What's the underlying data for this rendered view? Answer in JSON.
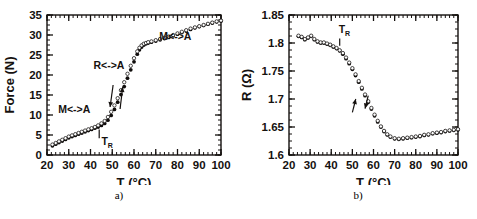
{
  "figure": {
    "caption_a": "a)",
    "caption_b": "b)"
  },
  "chart_data": [
    {
      "id": "panel-a",
      "type": "scatter",
      "title": "",
      "xlabel": "T (°C)",
      "ylabel": "Force (N)",
      "xlim": [
        20,
        100
      ],
      "ylim": [
        0,
        35
      ],
      "xticks": [
        20,
        30,
        40,
        50,
        60,
        70,
        80,
        90,
        100
      ],
      "yticks": [
        0,
        5,
        10,
        15,
        20,
        25,
        30,
        35
      ],
      "xminor_step": 2,
      "yminor_step": 1.25,
      "grid": false,
      "legend": "none",
      "annotations": [
        {
          "name": "phase-label-low",
          "text": "M<->A",
          "x": 32.5,
          "y": 10.5
        },
        {
          "name": "phase-label-mid",
          "text": "R<->A",
          "x": 48.5,
          "y": 21.5
        },
        {
          "name": "phase-label-high",
          "text": "M<->A",
          "x": 79.0,
          "y": 28.8
        },
        {
          "name": "transition-temp-label",
          "text": "T",
          "sub": "R",
          "x": 45.0,
          "y": 2.6
        }
      ],
      "tick_marker": {
        "name": "transition-temp-tick",
        "x": 44.0,
        "y0": 4.2,
        "y1": 6.4
      },
      "arrows": [
        {
          "name": "cooling-arrow",
          "x0": 50.4,
          "y0": 17.5,
          "x1": 49.0,
          "y1": 12.0,
          "dir": "down"
        },
        {
          "name": "heating-arrow",
          "x0": 53.6,
          "y0": 11.5,
          "x1": 54.8,
          "y1": 17.0,
          "dir": "up"
        }
      ],
      "series": [
        {
          "name": "heating",
          "marker": "filled",
          "x": [
            22.5,
            24.0,
            25.5,
            27.0,
            28.5,
            30.0,
            31.5,
            33.0,
            34.5,
            36.0,
            37.5,
            39.0,
            40.5,
            42.0,
            43.5,
            45.0,
            46.5,
            48.0,
            49.5,
            51.0,
            52.5,
            54.0,
            55.5,
            57.0,
            58.5,
            60.0,
            61.5,
            62.5,
            63.5,
            64.5,
            65.5,
            66.5,
            68.0,
            70.0,
            72.0,
            74.0,
            76.0,
            78.0,
            80.0,
            82.0,
            84.0,
            86.0,
            88.0,
            90.0,
            92.0,
            94.0,
            96.0,
            98.0,
            100.0
          ],
          "y": [
            2.3,
            2.7,
            3.1,
            3.5,
            3.9,
            4.3,
            4.6,
            4.9,
            5.2,
            5.5,
            5.8,
            6.1,
            6.4,
            6.7,
            7.0,
            7.4,
            7.9,
            8.7,
            9.9,
            11.4,
            13.2,
            15.1,
            17.1,
            19.2,
            21.3,
            23.3,
            25.2,
            26.3,
            27.0,
            27.5,
            27.8,
            28.0,
            28.2,
            28.5,
            28.8,
            29.1,
            29.4,
            29.8,
            30.2,
            30.6,
            31.0,
            31.4,
            31.8,
            32.1,
            32.4,
            32.7,
            33.0,
            33.3,
            33.5
          ]
        },
        {
          "name": "cooling",
          "marker": "open",
          "x": [
            22.5,
            24.0,
            25.5,
            27.0,
            28.5,
            30.0,
            31.5,
            33.0,
            34.5,
            36.0,
            37.5,
            39.0,
            40.5,
            42.0,
            43.5,
            45.0,
            46.5,
            48.0,
            49.5,
            51.0,
            52.5,
            54.0,
            55.5,
            57.0,
            58.5,
            60.0,
            61.5,
            62.5,
            63.5,
            64.5,
            65.5,
            66.5,
            68.0,
            70.0,
            72.0,
            74.0,
            76.0,
            78.0,
            80.0,
            82.0,
            84.0,
            86.0,
            88.0,
            90.0,
            92.0,
            94.0,
            96.0,
            98.0,
            100.0
          ],
          "y": [
            2.6,
            3.0,
            3.4,
            3.8,
            4.2,
            4.6,
            4.9,
            5.2,
            5.5,
            5.8,
            6.1,
            6.4,
            6.7,
            7.0,
            7.4,
            7.9,
            8.5,
            9.5,
            10.8,
            12.4,
            14.2,
            16.2,
            18.2,
            20.3,
            22.3,
            24.2,
            25.9,
            26.8,
            27.4,
            27.8,
            28.0,
            28.2,
            28.4,
            28.7,
            29.0,
            29.3,
            29.6,
            30.0,
            30.4,
            30.8,
            31.2,
            31.6,
            31.9,
            32.2,
            32.5,
            32.8,
            33.1,
            33.4,
            33.6
          ]
        }
      ]
    },
    {
      "id": "panel-b",
      "type": "scatter",
      "title": "",
      "xlabel": "T (°C)",
      "ylabel": "R (Ω)",
      "xlim": [
        20,
        100
      ],
      "ylim": [
        1.6,
        1.85
      ],
      "xticks": [
        20,
        30,
        40,
        50,
        60,
        70,
        80,
        90,
        100
      ],
      "yticks": [
        1.6,
        1.65,
        1.7,
        1.75,
        1.8,
        1.85
      ],
      "xminor_step": 2,
      "yminor_step": 0.0125,
      "grid": false,
      "legend": "none",
      "annotations": [
        {
          "name": "transition-temp-label",
          "text": "T",
          "sub": "R",
          "x": 43.5,
          "y": 1.818
        }
      ],
      "tick_marker": {
        "name": "transition-temp-tick",
        "x": 44.0,
        "y0": 1.795,
        "y1": 1.808
      },
      "arrows": [
        {
          "name": "heating-arrow",
          "x0": 50.0,
          "y0": 1.676,
          "x1": 51.6,
          "y1": 1.7,
          "dir": "up"
        },
        {
          "name": "cooling-arrow",
          "x0": 57.5,
          "y0": 1.706,
          "x1": 56.0,
          "y1": 1.683,
          "dir": "down"
        }
      ],
      "series": [
        {
          "name": "heating",
          "marker": "filled",
          "x": [
            24.5,
            26.0,
            27.5,
            29.0,
            30.5,
            32.0,
            33.5,
            35.0,
            36.5,
            38.0,
            39.5,
            41.0,
            42.5,
            44.0,
            45.5,
            47.0,
            48.5,
            50.0,
            51.5,
            53.0,
            54.5,
            56.0,
            57.5,
            59.0,
            60.5,
            62.0,
            63.5,
            65.0,
            66.5,
            68.0,
            70.0,
            72.0,
            74.0,
            76.0,
            78.0,
            80.0,
            82.0,
            84.0,
            86.0,
            88.0,
            90.0,
            92.0,
            94.0,
            96.0,
            98.0,
            100.0
          ],
          "y": [
            1.812,
            1.81,
            1.806,
            1.809,
            1.812,
            1.806,
            1.802,
            1.8,
            1.8,
            1.798,
            1.796,
            1.793,
            1.79,
            1.786,
            1.78,
            1.772,
            1.763,
            1.753,
            1.742,
            1.73,
            1.718,
            1.706,
            1.694,
            1.682,
            1.67,
            1.659,
            1.65,
            1.642,
            1.636,
            1.632,
            1.629,
            1.628,
            1.629,
            1.63,
            1.631,
            1.632,
            1.633,
            1.635,
            1.636,
            1.638,
            1.639,
            1.64,
            1.642,
            1.643,
            1.644,
            1.645
          ]
        },
        {
          "name": "cooling",
          "marker": "open",
          "x": [
            24.5,
            26.0,
            27.5,
            29.0,
            30.5,
            32.0,
            33.5,
            35.0,
            36.5,
            38.0,
            39.5,
            41.0,
            42.5,
            44.0,
            45.5,
            47.0,
            48.5,
            50.0,
            51.5,
            53.0,
            54.5,
            56.0,
            57.5,
            59.0,
            60.5,
            62.0,
            63.5,
            65.0,
            66.5,
            68.0,
            70.0,
            72.0,
            74.0,
            76.0,
            78.0,
            80.0,
            82.0,
            84.0,
            86.0,
            88.0,
            90.0,
            92.0,
            94.0,
            96.0,
            98.0,
            100.0
          ],
          "y": [
            1.813,
            1.811,
            1.807,
            1.81,
            1.813,
            1.807,
            1.803,
            1.801,
            1.801,
            1.799,
            1.797,
            1.794,
            1.791,
            1.787,
            1.782,
            1.774,
            1.765,
            1.755,
            1.744,
            1.732,
            1.72,
            1.708,
            1.696,
            1.684,
            1.672,
            1.661,
            1.651,
            1.643,
            1.637,
            1.633,
            1.63,
            1.629,
            1.63,
            1.631,
            1.632,
            1.633,
            1.634,
            1.636,
            1.637,
            1.639,
            1.64,
            1.641,
            1.643,
            1.644,
            1.645,
            1.646
          ]
        }
      ]
    }
  ]
}
